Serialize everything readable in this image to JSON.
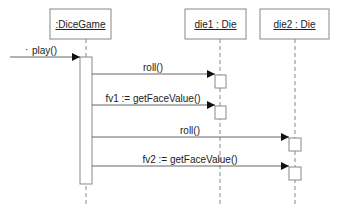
{
  "diagram": {
    "type": "uml-sequence",
    "participants": [
      {
        "id": "dicegame",
        "label": ":DiceGame",
        "x": 50,
        "w": 61,
        "lifeline_x": 86
      },
      {
        "id": "die1",
        "label": "die1 : Die",
        "x": 185,
        "w": 61,
        "lifeline_x": 220
      },
      {
        "id": "die2",
        "label": "die2 : Die",
        "x": 260,
        "w": 69,
        "lifeline_x": 295
      }
    ],
    "messages": [
      {
        "id": "play",
        "label": "play()",
        "from": "external",
        "to": "dicegame",
        "y": 57
      },
      {
        "id": "roll1",
        "label": "roll()",
        "from": "dicegame",
        "to": "die1",
        "y": 74
      },
      {
        "id": "fv1",
        "label": "fv1 := getFaceValue()",
        "from": "dicegame",
        "to": "die1",
        "y": 105
      },
      {
        "id": "roll2",
        "label": "roll()",
        "from": "dicegame",
        "to": "die2",
        "y": 137
      },
      {
        "id": "fv2",
        "label": "fv2 := getFaceValue()",
        "from": "dicegame",
        "to": "die2",
        "y": 166
      }
    ],
    "colors": {
      "line": "#555555",
      "box_stroke": "#777777",
      "text": "#222222"
    }
  }
}
